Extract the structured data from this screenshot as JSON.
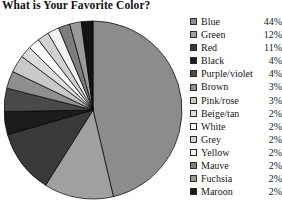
{
  "chart_data": {
    "type": "pie",
    "title": "What is Your Favorite Color?",
    "xlabel": "",
    "ylabel": "",
    "legend_position": "right",
    "grid": false,
    "start_angle_deg": 0,
    "direction": "clockwise",
    "categories": [
      "Blue",
      "Green",
      "Red",
      "Black",
      "Purple/violet",
      "Brown",
      "Pink/rose",
      "Beige/tan",
      "White",
      "Grey",
      "Yellow",
      "Mauve",
      "Fuchsia",
      "Maroon"
    ],
    "values": [
      44,
      12,
      11,
      4,
      4,
      3,
      3,
      2,
      2,
      2,
      2,
      2,
      2,
      2
    ],
    "value_labels": [
      "44%",
      "12%",
      "11%",
      "4%",
      "4%",
      "3%",
      "3%",
      "2%",
      "2%",
      "2%",
      "2%",
      "2%",
      "2%",
      "2%"
    ],
    "unit": "%",
    "slice_colors": [
      "#8c8c8c",
      "#a0a0a0",
      "#3a3a3a",
      "#1c1c1c",
      "#4a4a4a",
      "#8f8f8f",
      "#c8c8c8",
      "#dcdcdc",
      "#ffffff",
      "#d2d2d2",
      "#f2f2f2",
      "#7e7e7e",
      "#9a9a9a",
      "#141414"
    ],
    "slices": [
      {
        "label": "Blue",
        "value": 44,
        "value_label": "44%",
        "color": "#8c8c8c"
      },
      {
        "label": "Green",
        "value": 12,
        "value_label": "12%",
        "color": "#a0a0a0"
      },
      {
        "label": "Red",
        "value": 11,
        "value_label": "11%",
        "color": "#3a3a3a"
      },
      {
        "label": "Black",
        "value": 4,
        "value_label": "4%",
        "color": "#1c1c1c"
      },
      {
        "label": "Purple/violet",
        "value": 4,
        "value_label": "4%",
        "color": "#4a4a4a"
      },
      {
        "label": "Brown",
        "value": 3,
        "value_label": "3%",
        "color": "#8f8f8f"
      },
      {
        "label": "Pink/rose",
        "value": 3,
        "value_label": "3%",
        "color": "#c8c8c8"
      },
      {
        "label": "Beige/tan",
        "value": 2,
        "value_label": "2%",
        "color": "#dcdcdc"
      },
      {
        "label": "White",
        "value": 2,
        "value_label": "2%",
        "color": "#ffffff"
      },
      {
        "label": "Grey",
        "value": 2,
        "value_label": "2%",
        "color": "#d2d2d2"
      },
      {
        "label": "Yellow",
        "value": 2,
        "value_label": "2%",
        "color": "#f2f2f2"
      },
      {
        "label": "Mauve",
        "value": 2,
        "value_label": "2%",
        "color": "#7e7e7e"
      },
      {
        "label": "Fuchsia",
        "value": 2,
        "value_label": "2%",
        "color": "#9a9a9a"
      },
      {
        "label": "Maroon",
        "value": 2,
        "value_label": "2%",
        "color": "#141414"
      }
    ]
  },
  "colors": {
    "background": "#ffffff",
    "text": "#161616",
    "slice_outline": "#000000",
    "swatch_border": "#2b2b2b"
  }
}
